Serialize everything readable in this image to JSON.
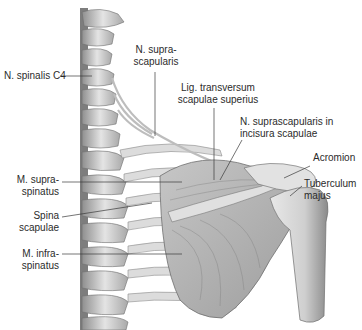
{
  "figure": {
    "colors": {
      "background": "#ffffff",
      "bone": "#d9d9d9",
      "bone_shadow": "#9a9a9a",
      "muscle": "#b8b8b8",
      "nerve": "#e6e6e6",
      "leader_line": "#3a3a3a",
      "text": "#2b2b2b"
    }
  },
  "labels": {
    "n_spinalis_c4": {
      "lines": [
        "N. spinalis C4"
      ]
    },
    "n_suprascapularis": {
      "lines": [
        "N. supra-",
        "scapularis"
      ]
    },
    "lig_transversum": {
      "lines": [
        "Lig. transversum",
        "scapulae superius"
      ]
    },
    "n_suprascap_incisura": {
      "lines": [
        "N. suprascapularis in",
        "incisura scapulae"
      ]
    },
    "acromion": {
      "lines": [
        "Acromion"
      ]
    },
    "tuberculum_majus": {
      "lines": [
        "Tuberculum",
        "majus"
      ]
    },
    "m_supraspinatus": {
      "lines": [
        "M. supra-",
        "spinatus"
      ]
    },
    "spina_scapulae": {
      "lines": [
        "Spina",
        "scapulae"
      ]
    },
    "m_infraspinatus": {
      "lines": [
        "M. infra-",
        "spinatus"
      ]
    }
  }
}
